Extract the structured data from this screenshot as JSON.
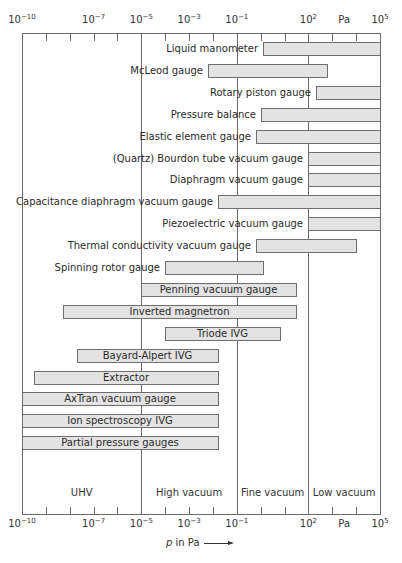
{
  "chart_data": {
    "type": "bar",
    "subtype": "horizontal-range (floating bars) on log scale",
    "title": "",
    "xlabel": "p in Pa",
    "xlabel_italic_part": "p",
    "xlabel_rest": " in Pa",
    "xscale": "log10",
    "xlim": [
      1e-10,
      100000.0
    ],
    "x_tick_labels": [
      {
        "base": "10",
        "exp": "−10",
        "value": -10
      },
      {
        "base": "10",
        "exp": "−7",
        "value": -7
      },
      {
        "base": "10",
        "exp": "−5",
        "value": -5
      },
      {
        "base": "10",
        "exp": "−3",
        "value": -3
      },
      {
        "base": "10",
        "exp": "−1",
        "value": -1
      },
      {
        "base": "10",
        "exp": "2",
        "value": 2
      },
      {
        "base": "Pa",
        "exp": "",
        "value": 3.5
      },
      {
        "base": "10",
        "exp": "5",
        "value": 5
      }
    ],
    "minor_ticks_log10": [
      -9,
      -8,
      -7,
      -6,
      -4,
      -3,
      -2,
      0,
      1,
      3,
      4
    ],
    "major_gridlines_log10": [
      -5,
      -1,
      2
    ],
    "regions": [
      {
        "label": "UHV",
        "from_log10": -10,
        "to_log10": -5
      },
      {
        "label": "High vacuum",
        "from_log10": -5,
        "to_log10": -1
      },
      {
        "label": "Fine vacuum",
        "from_log10": -1,
        "to_log10": 2
      },
      {
        "label": "Low vacuum",
        "from_log10": 2,
        "to_log10": 5
      }
    ],
    "series": [
      {
        "name": "Liquid manometer",
        "from_log10": 0.1,
        "to_log10": 5,
        "label_pos": "left"
      },
      {
        "name": "McLeod gauge",
        "from_log10": -2.2,
        "to_log10": 2.8,
        "label_pos": "left"
      },
      {
        "name": "Rotary piston gauge",
        "from_log10": 2.3,
        "to_log10": 5,
        "label_pos": "left"
      },
      {
        "name": "Pressure balance",
        "from_log10": 0,
        "to_log10": 5,
        "label_pos": "left"
      },
      {
        "name": "Elastic element gauge",
        "from_log10": -0.2,
        "to_log10": 5,
        "label_pos": "left"
      },
      {
        "name": "(Quartz) Bourdon tube vacuum gauge",
        "from_log10": 2,
        "to_log10": 5,
        "label_pos": "left"
      },
      {
        "name": "Diaphragm vacuum gauge",
        "from_log10": 2,
        "to_log10": 5,
        "label_pos": "left"
      },
      {
        "name": "Capacitance diaphragm vacuum gauge",
        "from_log10": -1.8,
        "to_log10": 5,
        "label_pos": "left"
      },
      {
        "name": "Piezoelectric vacuum gauge",
        "from_log10": 2,
        "to_log10": 5,
        "label_pos": "left"
      },
      {
        "name": "Thermal conductivity vacuum gauge",
        "from_log10": -0.2,
        "to_log10": 4,
        "label_pos": "left"
      },
      {
        "name": "Spinning rotor gauge",
        "from_log10": -4,
        "to_log10": 0.1,
        "label_pos": "left"
      },
      {
        "name": "Penning vacuum gauge",
        "from_log10": -5,
        "to_log10": 1.5,
        "label_pos": "inside"
      },
      {
        "name": "Inverted magnetron",
        "from_log10": -8.3,
        "to_log10": 1.5,
        "label_pos": "inside"
      },
      {
        "name": "Triode IVG",
        "from_log10": -4,
        "to_log10": 0.8,
        "label_pos": "inside"
      },
      {
        "name": "Bayard-Alpert IVG",
        "from_log10": -7.7,
        "to_log10": -1.8,
        "label_pos": "inside"
      },
      {
        "name": "Extractor",
        "from_log10": -9.5,
        "to_log10": -1.8,
        "label_pos": "inside"
      },
      {
        "name": "AxTran vacuum gauge",
        "from_log10": -10,
        "to_log10": -1.8,
        "label_pos": "inside"
      },
      {
        "name": "Ion spectroscopy IVG",
        "from_log10": -10,
        "to_log10": -1.8,
        "label_pos": "inside"
      },
      {
        "name": "Partial pressure gauges",
        "from_log10": -10,
        "to_log10": -1.8,
        "label_pos": "inside"
      }
    ],
    "grid": false,
    "legend": "none",
    "colors": {
      "bar_fill": "#e3e3e3",
      "bar_border": "#6e6e6e",
      "axis": "#6a6a6a",
      "text": "#2b2b2b"
    }
  }
}
